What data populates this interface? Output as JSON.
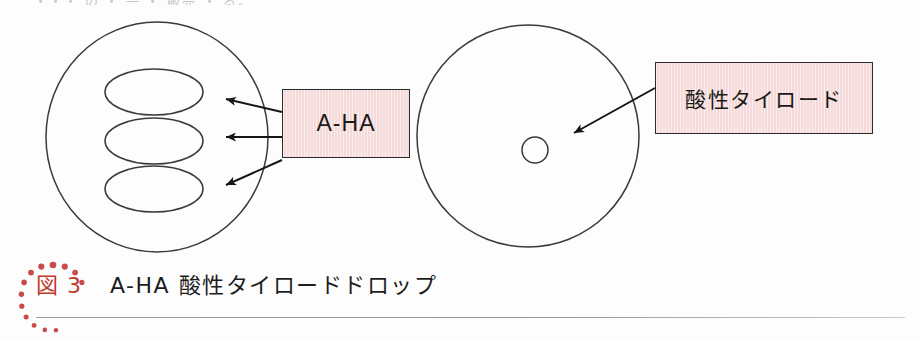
{
  "page": {
    "background_color": "#fdfdfd",
    "width": 921,
    "height": 339,
    "cropped_header_text": "・・・ の ・ 一 ・ 販売 ・ る。"
  },
  "figure": {
    "left_cell": {
      "name": "large-circle-with-three-ellipses",
      "shape": "circle",
      "ellipse_count": 3
    },
    "right_cell": {
      "name": "large-circle-with-nucleus",
      "shape": "circle",
      "nucleus": "small-circle"
    },
    "boxes": [
      {
        "id": "aha",
        "label": "A-HA",
        "fill_color": "#f6d9d9",
        "border_color": "#2b2b2b",
        "arrow_count": 3
      },
      {
        "id": "acid",
        "label": "酸性タイロード",
        "fill_color": "#f6d9d9",
        "border_color": "#2b2b2b",
        "arrow_count": 1
      }
    ],
    "stroke_color": "#333333"
  },
  "caption": {
    "figure_number": "図 3",
    "figure_number_color": "#c0392b",
    "text": "A-HA 酸性タイロードドロップ",
    "text_color": "#1d1d1d",
    "decor": "red-dotted-arc"
  },
  "rule": {
    "color": "#9aa0a6"
  }
}
